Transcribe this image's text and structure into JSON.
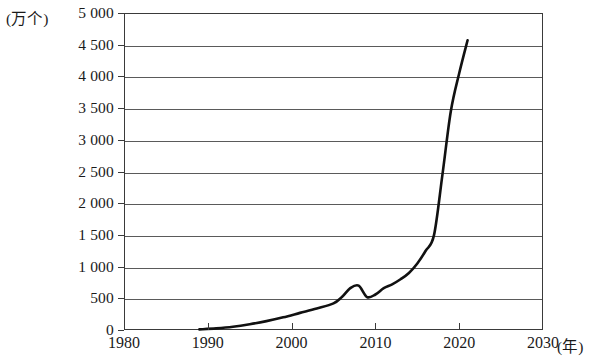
{
  "chart_data": {
    "type": "line",
    "title": "",
    "xlabel": "(年)",
    "ylabel": "(万个)",
    "xlim": [
      1980,
      2030
    ],
    "ylim": [
      0,
      5000
    ],
    "grid": true,
    "legend": null,
    "y_ticks": [
      "0",
      "500",
      "1 000",
      "1 500",
      "2 000",
      "2 500",
      "3 000",
      "3 500",
      "4 000",
      "4 500",
      "5 000"
    ],
    "y_tick_values": [
      0,
      500,
      1000,
      1500,
      2000,
      2500,
      3000,
      3500,
      4000,
      4500,
      5000
    ],
    "x_ticks": [
      "1980",
      "1990",
      "2000",
      "2010",
      "2020",
      "2030"
    ],
    "x_tick_values": [
      1980,
      1990,
      2000,
      2010,
      2020,
      2030
    ],
    "series": [
      {
        "name": "",
        "x": [
          1989,
          1991,
          1993,
          1995,
          1997,
          1999,
          2001,
          2003,
          2005,
          2006,
          2007,
          2008,
          2009,
          2010,
          2011,
          2012,
          2013,
          2014,
          2015,
          2016,
          2017,
          2018,
          2019,
          2020,
          2021
        ],
        "values": [
          10,
          25,
          50,
          90,
          140,
          200,
          270,
          340,
          420,
          520,
          660,
          700,
          520,
          560,
          660,
          720,
          800,
          900,
          1050,
          1250,
          1500,
          2450,
          3450,
          4050,
          4570
        ]
      }
    ]
  },
  "axis": {
    "unit_y": "(万个)",
    "unit_x": "(年)"
  }
}
